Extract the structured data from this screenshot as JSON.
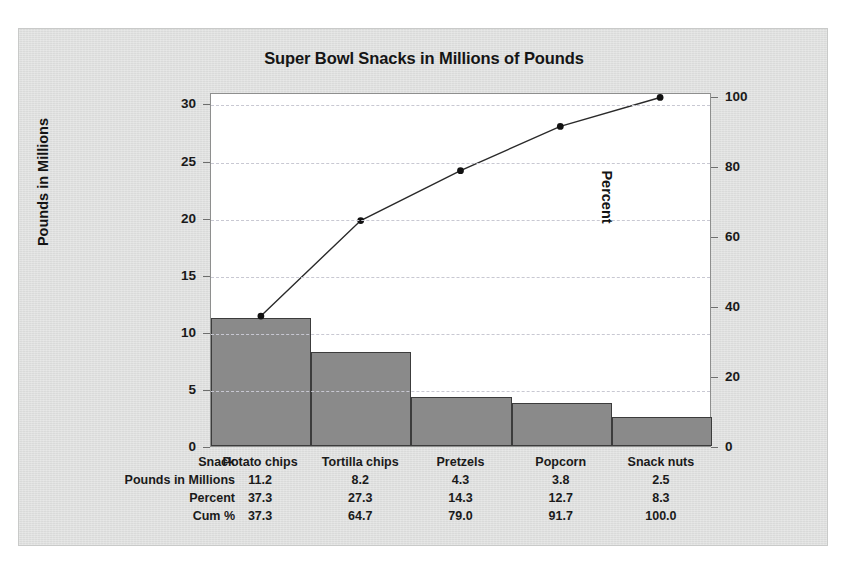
{
  "chart_data": {
    "type": "bar",
    "title": "Super Bowl Snacks in Millions of Pounds",
    "categories": [
      "Potato chips",
      "Tortilla chips",
      "Pretzels",
      "Popcorn",
      "Snack nuts"
    ],
    "values": [
      11.2,
      8.2,
      4.3,
      3.8,
      2.5
    ],
    "cumulative_percent": [
      37.3,
      64.7,
      79.0,
      91.7,
      100.0
    ],
    "percent": [
      37.3,
      27.3,
      14.3,
      12.7,
      8.3
    ],
    "xlabel": "",
    "ylabel": "Pounds in Millions",
    "y2label": "Percent",
    "ylim": [
      0,
      31
    ],
    "y2lim": [
      0,
      101
    ],
    "yticks": [
      "0",
      "5",
      "10",
      "15",
      "20",
      "25",
      "30"
    ],
    "ytick_values": [
      0,
      5,
      10,
      15,
      20,
      25,
      30
    ],
    "y2ticks": [
      "0",
      "20",
      "40",
      "60",
      "80",
      "100"
    ],
    "y2tick_values": [
      0,
      20,
      40,
      60,
      80,
      100
    ],
    "grid": true,
    "legend": "none",
    "bar_color": "#8a8a8a",
    "bar_edge_color": "#3c3c3c",
    "line_color": "#2a2a2a",
    "marker_color": "#111111",
    "plot_bg": "#ffffff",
    "panel_bg": "#dddedd"
  },
  "title": "Super Bowl Snacks in Millions of Pounds",
  "axis": {
    "left_title": "Pounds in Millions",
    "right_title": "Percent"
  },
  "table": {
    "rows": [
      {
        "label": "Snack",
        "cells": [
          "Potato chips",
          "Tortilla chips",
          "Pretzels",
          "Popcorn",
          "Snack nuts"
        ]
      },
      {
        "label": "Pounds in Millions",
        "cells": [
          "11.2",
          "8.2",
          "4.3",
          "3.8",
          "2.5"
        ]
      },
      {
        "label": "Percent",
        "cells": [
          "37.3",
          "27.3",
          "14.3",
          "12.7",
          "8.3"
        ]
      },
      {
        "label": "Cum %",
        "cells": [
          "37.3",
          "64.7",
          "79.0",
          "91.7",
          "100.0"
        ]
      }
    ]
  }
}
